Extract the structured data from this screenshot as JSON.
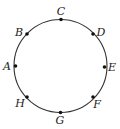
{
  "diagram": {
    "type": "circle-with-points",
    "circle": {
      "cx": 60.5,
      "cy": 66,
      "r": 46.5,
      "stroke": "#333333"
    },
    "points": [
      {
        "label": "A",
        "x": 15.5,
        "y": 66,
        "lx": 7,
        "ly": 70
      },
      {
        "label": "B",
        "x": 27,
        "y": 34,
        "lx": 19,
        "ly": 36
      },
      {
        "label": "C",
        "x": 61,
        "y": 19.5,
        "lx": 61,
        "ly": 15
      },
      {
        "label": "D",
        "x": 93,
        "y": 34,
        "lx": 101,
        "ly": 36
      },
      {
        "label": "E",
        "x": 104.5,
        "y": 67,
        "lx": 112,
        "ly": 71
      },
      {
        "label": "F",
        "x": 93,
        "y": 97,
        "lx": 97,
        "ly": 108
      },
      {
        "label": "G",
        "x": 60.5,
        "y": 112.5,
        "lx": 60,
        "ly": 124
      },
      {
        "label": "H",
        "x": 27,
        "y": 97,
        "lx": 20,
        "ly": 107
      }
    ]
  }
}
